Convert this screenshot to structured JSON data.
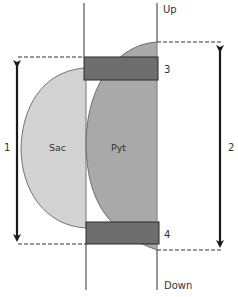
{
  "diagram": {
    "labels": {
      "up": "Up",
      "down": "Down",
      "sac": "Sac",
      "pyt": "Pyt",
      "marker_top": "3",
      "marker_bottom": "4",
      "dimension_left": "1",
      "dimension_right": "2"
    },
    "colors": {
      "sac_fill": "#d3d3d3",
      "pyt_fill": "#a9a9a9",
      "block_fill": "#6e6e6e",
      "outline": "#333333",
      "arrow": "#1a1a1a"
    }
  }
}
